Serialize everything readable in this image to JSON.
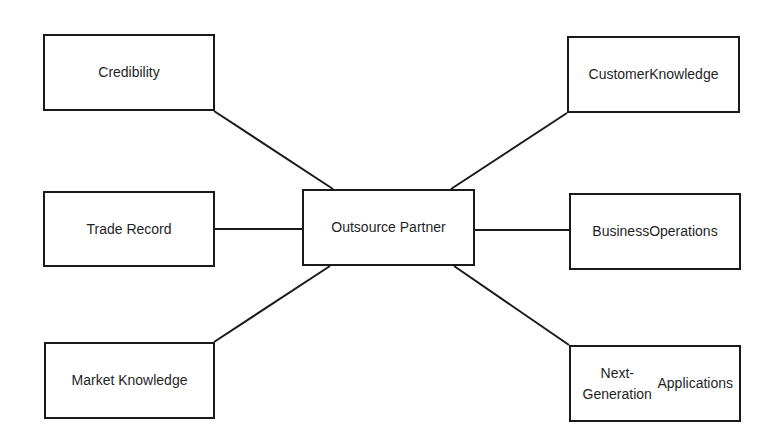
{
  "diagram": {
    "type": "hub-and-spoke",
    "center": {
      "id": "outsource-partner",
      "label": "Outsource Partner",
      "box": [
        302,
        189,
        173,
        77
      ]
    },
    "nodes": [
      {
        "id": "credibility",
        "lines": [
          "Credibility"
        ],
        "box": [
          43,
          34,
          172,
          77
        ]
      },
      {
        "id": "customer-knowledge",
        "lines": [
          "Customer",
          "Knowledge"
        ],
        "box": [
          567,
          36,
          173,
          77
        ]
      },
      {
        "id": "trade-record",
        "lines": [
          "Trade Record"
        ],
        "box": [
          43,
          191,
          172,
          76
        ]
      },
      {
        "id": "business-operations",
        "lines": [
          "Business",
          "Operations"
        ],
        "box": [
          569,
          193,
          172,
          77
        ]
      },
      {
        "id": "market-knowledge",
        "lines": [
          "Market Knowledge"
        ],
        "box": [
          44,
          342,
          171,
          77
        ]
      },
      {
        "id": "next-generation-applications",
        "lines": [
          "Next-Generation",
          "Applications"
        ],
        "box": [
          569,
          345,
          172,
          77
        ]
      }
    ],
    "edges": [
      {
        "from": "credibility",
        "to": "outsource-partner",
        "x1": 214,
        "y1": 111,
        "x2": 333,
        "y2": 189
      },
      {
        "from": "customer-knowledge",
        "to": "outsource-partner",
        "x1": 567,
        "y1": 113,
        "x2": 451,
        "y2": 189
      },
      {
        "from": "trade-record",
        "to": "outsource-partner",
        "x1": 214,
        "y1": 229,
        "x2": 302,
        "y2": 229
      },
      {
        "from": "outsource-partner",
        "to": "business-operations",
        "x1": 475,
        "y1": 230,
        "x2": 569,
        "y2": 230
      },
      {
        "from": "outsource-partner",
        "to": "market-knowledge",
        "x1": 330,
        "y1": 266,
        "x2": 214,
        "y2": 342
      },
      {
        "from": "outsource-partner",
        "to": "next-generation-applications",
        "x1": 454,
        "y1": 266,
        "x2": 569,
        "y2": 345
      }
    ],
    "colors": {
      "stroke": "#1a1a1a",
      "text": "#1f1f1f",
      "background": "#ffffff"
    }
  }
}
